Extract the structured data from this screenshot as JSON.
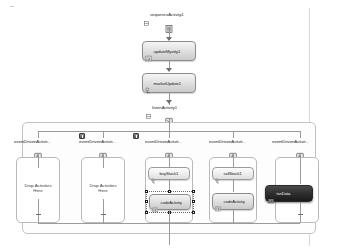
{
  "designer": {
    "title": "Workflow Designer Canvas",
    "background_color": "#ffffff",
    "line_color": "#9a9a9a"
  },
  "root": {
    "label": "sequenceActivity1",
    "icon": "sequence-activity-icon"
  },
  "sequence_activities": [
    {
      "label": "updateMyst",
      "sublabel": "ity1",
      "full_label": "updateMystity1",
      "icon": "code-activity-icon"
    },
    {
      "label": "marketUpda",
      "sublabel": "te1",
      "full_label": "marketUpdate1",
      "icon": "handle-external-event-icon"
    }
  ],
  "listen": {
    "label": "listenActivity1",
    "icon": "listen-activity-icon"
  },
  "branches": [
    {
      "label": "eventDrivenActivit...",
      "icon": "event-driven-activity-icon",
      "has_warning": true,
      "warning_icon": "warning-badge-icon",
      "drop_text_line1": "Drop Activities",
      "drop_text_line2": "Here",
      "children": []
    },
    {
      "label": "eventDrivenActivit...",
      "icon": "event-driven-activity-icon",
      "has_warning": true,
      "warning_icon": "warning-badge-icon",
      "drop_text_line1": "Drop Activities",
      "drop_text_line2": "Here",
      "children": []
    },
    {
      "label": "eventDrivenActivit...",
      "icon": "event-driven-activity-icon",
      "has_warning": false,
      "children": [
        {
          "label": "buyStock1",
          "sublabel": "",
          "icon": "handle-external-event-icon",
          "style": "small",
          "selected": false
        },
        {
          "label": "codeActivity",
          "sublabel": "3",
          "icon": "code-activity-icon",
          "style": "normal",
          "selected": true
        }
      ]
    },
    {
      "label": "eventDrivenActivit...",
      "icon": "event-driven-activity-icon",
      "has_warning": false,
      "children": [
        {
          "label": "sellStock1",
          "sublabel": "",
          "icon": "handle-external-event-icon",
          "style": "small",
          "selected": false
        },
        {
          "label": "codeActivity",
          "sublabel": "2",
          "icon": "code-activity-icon",
          "style": "normal",
          "selected": false
        }
      ]
    },
    {
      "label": "eventDrivenActivit...",
      "icon": "event-driven-activity-icon",
      "has_warning": false,
      "children": [
        {
          "label": "tsnData",
          "sublabel": "",
          "icon": "code-activity-icon",
          "style": "dark",
          "selected": false
        }
      ]
    }
  ]
}
